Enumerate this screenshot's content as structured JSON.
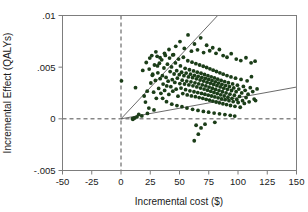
{
  "chart_data": {
    "type": "scatter",
    "title": "",
    "xlabel": "Incremental cost ($)",
    "ylabel": "Incremental Effect (QALYs)",
    "xlim": [
      -50,
      150
    ],
    "ylim": [
      -0.005,
      0.01
    ],
    "xticks": [
      -50,
      -25,
      0,
      25,
      50,
      75,
      100,
      125,
      150
    ],
    "xticklabels": [
      "-50",
      "-25",
      "0",
      "25",
      "50",
      "75",
      "100",
      "125",
      "150"
    ],
    "yticks": [
      -0.005,
      0,
      0.005,
      0.01
    ],
    "yticklabels": [
      "-.005",
      "0",
      ".005",
      ".01"
    ],
    "grid": false,
    "legend": null,
    "point_color": "#1b3d18",
    "point_size": 1.9,
    "reference_lines": [
      {
        "name": "x-zero-dashed",
        "orientation": "vertical",
        "value": 0,
        "style": "dashed"
      },
      {
        "name": "y-zero-dashed",
        "orientation": "horizontal",
        "value": 0,
        "style": "dashed"
      }
    ],
    "wtp_rays": [
      {
        "name": "steep-threshold-ray",
        "origin": [
          0,
          0
        ],
        "slope_per_dollar": 0.000121,
        "style": "solid"
      },
      {
        "name": "shallow-threshold-ray",
        "origin": [
          0,
          0
        ],
        "slope_per_dollar": 2.05e-05,
        "style": "solid"
      }
    ],
    "cluster_summary": {
      "n_points": 620,
      "x_mean": 64,
      "x_sd": 17,
      "y_mean": 0.0038,
      "y_sd": 0.0011,
      "x_range": [
        0,
        118
      ],
      "y_range": [
        -0.0022,
        0.0088
      ]
    },
    "points": [
      [
        0.4,
        0.00368
      ],
      [
        10.2,
        -5e-05
      ],
      [
        11.5,
        8e-05
      ],
      [
        12.4,
        0.00302
      ],
      [
        18.6,
        0.00468
      ],
      [
        19.8,
        0.00221
      ],
      [
        20.9,
        0.00162
      ],
      [
        21.6,
        0.00545
      ],
      [
        22.4,
        0.00268
      ],
      [
        23.8,
        0.00104
      ],
      [
        24.6,
        0.00588
      ],
      [
        25.5,
        0.00347
      ],
      [
        26.3,
        0.00612
      ],
      [
        27.1,
        0.00432
      ],
      [
        27.9,
        0.00258
      ],
      [
        28.6,
        0.00521
      ],
      [
        29.4,
        0.00372
      ],
      [
        30.2,
        0.00198
      ],
      [
        30.9,
        0.00605
      ],
      [
        31.5,
        0.00445
      ],
      [
        32.2,
        0.00294
      ],
      [
        32.8,
        0.00538
      ],
      [
        33.5,
        0.00389
      ],
      [
        34.1,
        0.00247
      ],
      [
        34.8,
        0.00571
      ],
      [
        35.4,
        0.00418
      ],
      [
        36.0,
        0.00336
      ],
      [
        36.7,
        0.00492
      ],
      [
        37.3,
        0.00275
      ],
      [
        37.9,
        0.00614
      ],
      [
        38.5,
        0.00401
      ],
      [
        39.1,
        0.00318
      ],
      [
        39.7,
        0.00529
      ],
      [
        40.3,
        0.00364
      ],
      [
        40.9,
        0.00236
      ],
      [
        41.5,
        0.00588
      ],
      [
        42.0,
        0.00457
      ],
      [
        42.6,
        0.00311
      ],
      [
        43.2,
        0.00502
      ],
      [
        43.8,
        0.00379
      ],
      [
        44.3,
        0.00268
      ],
      [
        44.9,
        0.00621
      ],
      [
        45.4,
        0.00434
      ],
      [
        46.0,
        0.00352
      ],
      [
        46.5,
        0.00541
      ],
      [
        47.1,
        0.00287
      ],
      [
        47.6,
        0.00466
      ],
      [
        48.2,
        0.00393
      ],
      [
        48.7,
        0.00219
      ],
      [
        49.2,
        0.00578
      ],
      [
        49.8,
        0.00427
      ],
      [
        50.3,
        0.00341
      ],
      [
        50.8,
        0.00512
      ],
      [
        51.3,
        0.00298
      ],
      [
        51.8,
        0.00451
      ],
      [
        52.3,
        0.00374
      ],
      [
        52.8,
        0.00244
      ],
      [
        53.3,
        0.00596
      ],
      [
        53.8,
        0.00418
      ],
      [
        54.3,
        0.00337
      ],
      [
        54.8,
        0.00489
      ],
      [
        55.2,
        0.00282
      ],
      [
        55.7,
        0.00443
      ],
      [
        56.2,
        0.00365
      ],
      [
        56.6,
        0.00231
      ],
      [
        57.1,
        0.00562
      ],
      [
        57.6,
        0.00406
      ],
      [
        58.0,
        0.00328
      ],
      [
        58.5,
        0.00475
      ],
      [
        58.9,
        0.00271
      ],
      [
        59.4,
        0.00432
      ],
      [
        59.8,
        0.00358
      ],
      [
        60.2,
        0.00222
      ],
      [
        60.7,
        0.00548
      ],
      [
        61.1,
        0.00398
      ],
      [
        61.5,
        0.00319
      ],
      [
        62.0,
        0.00464
      ],
      [
        62.4,
        0.00262
      ],
      [
        62.8,
        0.00421
      ],
      [
        63.2,
        0.00348
      ],
      [
        63.6,
        0.00214
      ],
      [
        64.0,
        0.00534
      ],
      [
        64.4,
        0.00387
      ],
      [
        64.8,
        0.00309
      ],
      [
        65.2,
        0.00452
      ],
      [
        65.6,
        0.00254
      ],
      [
        66.0,
        0.00411
      ],
      [
        66.4,
        0.00339
      ],
      [
        66.8,
        0.00206
      ],
      [
        67.2,
        0.00521
      ],
      [
        67.6,
        0.00376
      ],
      [
        68.0,
        0.00298
      ],
      [
        68.4,
        0.00441
      ],
      [
        68.8,
        0.00246
      ],
      [
        69.1,
        0.00402
      ],
      [
        69.5,
        0.00328
      ],
      [
        69.9,
        0.00198
      ],
      [
        70.3,
        0.00509
      ],
      [
        70.6,
        0.00366
      ],
      [
        71.0,
        0.00288
      ],
      [
        71.4,
        0.00429
      ],
      [
        71.7,
        0.00238
      ],
      [
        72.1,
        0.00392
      ],
      [
        72.5,
        0.00318
      ],
      [
        72.8,
        0.00189
      ],
      [
        73.2,
        0.00497
      ],
      [
        73.5,
        0.00355
      ],
      [
        73.9,
        0.00277
      ],
      [
        74.3,
        0.00418
      ],
      [
        74.6,
        0.00229
      ],
      [
        75.0,
        0.00381
      ],
      [
        75.3,
        0.00307
      ],
      [
        75.7,
        0.00181
      ],
      [
        76.0,
        0.00484
      ],
      [
        76.4,
        0.00344
      ],
      [
        76.7,
        0.00266
      ],
      [
        77.1,
        0.00407
      ],
      [
        77.4,
        0.00221
      ],
      [
        77.8,
        0.00369
      ],
      [
        78.1,
        0.00296
      ],
      [
        78.5,
        0.00172
      ],
      [
        78.8,
        0.00471
      ],
      [
        79.2,
        0.00333
      ],
      [
        79.5,
        0.00255
      ],
      [
        79.9,
        0.00396
      ],
      [
        80.2,
        0.00212
      ],
      [
        80.6,
        0.00358
      ],
      [
        80.9,
        0.00285
      ],
      [
        81.3,
        0.00163
      ],
      [
        81.6,
        0.00458
      ],
      [
        82.0,
        0.00321
      ],
      [
        82.3,
        0.00244
      ],
      [
        82.7,
        0.00384
      ],
      [
        83.0,
        0.00203
      ],
      [
        83.4,
        0.00346
      ],
      [
        83.8,
        0.00273
      ],
      [
        84.1,
        0.00155
      ],
      [
        84.5,
        0.00445
      ],
      [
        84.8,
        0.00309
      ],
      [
        85.2,
        0.00232
      ],
      [
        85.6,
        0.00372
      ],
      [
        85.9,
        0.00194
      ],
      [
        86.3,
        0.00334
      ],
      [
        86.7,
        0.00262
      ],
      [
        87.1,
        0.00146
      ],
      [
        87.4,
        0.00432
      ],
      [
        87.8,
        0.00297
      ],
      [
        88.2,
        0.00221
      ],
      [
        88.6,
        0.00361
      ],
      [
        89.0,
        0.00185
      ],
      [
        89.4,
        0.00322
      ],
      [
        89.8,
        0.00251
      ],
      [
        90.2,
        0.00138
      ],
      [
        90.6,
        0.00419
      ],
      [
        91.0,
        0.00286
      ],
      [
        91.4,
        0.00209
      ],
      [
        91.8,
        0.00349
      ],
      [
        92.3,
        0.00176
      ],
      [
        92.7,
        0.00311
      ],
      [
        93.1,
        0.00239
      ],
      [
        93.6,
        0.00129
      ],
      [
        94.0,
        0.00406
      ],
      [
        94.5,
        0.00274
      ],
      [
        94.9,
        0.00198
      ],
      [
        95.4,
        0.00338
      ],
      [
        95.9,
        0.00167
      ],
      [
        96.4,
        0.00299
      ],
      [
        96.9,
        0.00228
      ],
      [
        97.4,
        0.00121
      ],
      [
        97.9,
        0.00393
      ],
      [
        98.4,
        0.00263
      ],
      [
        99.0,
        0.00187
      ],
      [
        99.5,
        0.00326
      ],
      [
        100.1,
        0.00158
      ],
      [
        100.7,
        0.00288
      ],
      [
        101.3,
        0.00217
      ],
      [
        101.9,
        0.00112
      ],
      [
        102.6,
        0.00381
      ],
      [
        103.2,
        0.00251
      ],
      [
        103.9,
        0.00176
      ],
      [
        104.6,
        0.00314
      ],
      [
        105.4,
        0.00149
      ],
      [
        106.1,
        0.00276
      ],
      [
        106.9,
        0.00206
      ],
      [
        107.8,
        0.00368
      ],
      [
        108.6,
        0.00239
      ],
      [
        109.5,
        0.00165
      ],
      [
        110.5,
        0.00302
      ],
      [
        111.5,
        0.00408
      ],
      [
        112.6,
        0.00264
      ],
      [
        113.8,
        0.00191
      ],
      [
        115.0,
        0.00177
      ],
      [
        116.3,
        0.00289
      ],
      [
        46.8,
        0.00702
      ],
      [
        50.4,
        0.00748
      ],
      [
        54.1,
        0.00681
      ],
      [
        57.3,
        0.00812
      ],
      [
        60.2,
        0.00655
      ],
      [
        62.8,
        0.00724
      ],
      [
        65.4,
        0.00668
      ],
      [
        68.1,
        0.00784
      ],
      [
        70.6,
        0.00641
      ],
      [
        73.2,
        0.00712
      ],
      [
        75.8,
        0.00659
      ],
      [
        78.4,
        0.00688
      ],
      [
        81.2,
        0.00634
      ],
      [
        84.1,
        0.00671
      ],
      [
        87.3,
        0.00612
      ],
      [
        90.6,
        0.00596
      ],
      [
        94.2,
        0.00631
      ],
      [
        98.5,
        0.00578
      ],
      [
        102.4,
        0.00564
      ],
      [
        106.8,
        0.00591
      ],
      [
        111.2,
        0.00542
      ],
      [
        114.6,
        0.00558
      ],
      [
        29.8,
        0.00648
      ],
      [
        33.4,
        0.00592
      ],
      [
        37.2,
        0.00634
      ],
      [
        41.0,
        0.00671
      ],
      [
        44.2,
        0.00618
      ],
      [
        24.1,
        0.00482
      ],
      [
        26.8,
        0.00421
      ],
      [
        31.2,
        0.00512
      ],
      [
        35.6,
        0.00198
      ],
      [
        38.9,
        0.00166
      ],
      [
        43.4,
        0.00142
      ],
      [
        47.8,
        0.00128
      ],
      [
        52.1,
        0.00118
      ],
      [
        56.4,
        0.00104
      ],
      [
        61.2,
        0.00092
      ],
      [
        65.8,
        0.00081
      ],
      [
        70.4,
        0.00072
      ],
      [
        74.9,
        0.00064
      ],
      [
        79.6,
        0.00056
      ],
      [
        84.2,
        0.00048
      ],
      [
        88.8,
        0.00041
      ],
      [
        93.4,
        0.00034
      ],
      [
        97.2,
        0.00027
      ],
      [
        64.2,
        -0.00062
      ],
      [
        68.4,
        -0.00088
      ],
      [
        66.1,
        -0.00148
      ],
      [
        71.8,
        -0.00052
      ],
      [
        62.6,
        -0.00212
      ],
      [
        80.2,
        -0.00034
      ],
      [
        28.2,
        0.00086
      ],
      [
        22.6,
        0.00052
      ],
      [
        17.8,
        0.00028
      ],
      [
        15.2,
        0.00042
      ],
      [
        13.6,
        0.00018
      ],
      [
        9.8,
        2e-05
      ]
    ]
  },
  "axis": {
    "x_title": "Incremental cost ($)",
    "y_title": "Incremental Effect (QALYs)"
  }
}
